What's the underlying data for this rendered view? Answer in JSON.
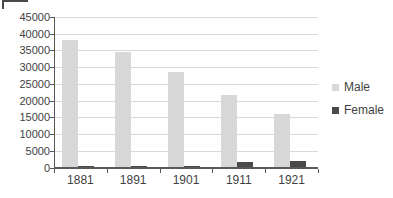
{
  "chart_data": {
    "type": "bar",
    "title": "",
    "xlabel": "",
    "ylabel": "",
    "categories": [
      "1881",
      "1891",
      "1901",
      "1911",
      "1921"
    ],
    "series": [
      {
        "name": "Male",
        "color": "#d8d8d8",
        "values": [
          38200,
          34500,
          28500,
          21800,
          16000
        ]
      },
      {
        "name": "Female",
        "color": "#4a4a4a",
        "values": [
          300,
          300,
          500,
          1500,
          1800
        ]
      }
    ],
    "ylim": [
      0,
      45000
    ],
    "y_tick_step": 5000,
    "y_tick_labels": [
      "0",
      "5000",
      "10000",
      "15000",
      "20000",
      "25000",
      "30000",
      "35000",
      "40000",
      "45000"
    ],
    "grid": "horizontal",
    "legend_position": "right"
  },
  "colors": {
    "background": "#ffffff",
    "gridline": "#d9d9d9",
    "axis": "#595959",
    "text": "#3f3f3f"
  }
}
